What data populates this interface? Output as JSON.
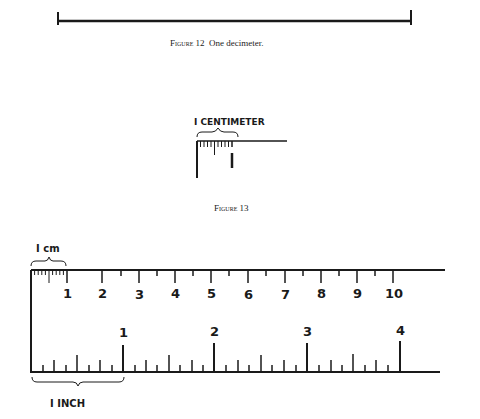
{
  "figure12": {
    "caption_label": "Figure 12",
    "caption_text": "One decimeter.",
    "line": {
      "x1": 58,
      "x2": 411,
      "y": 22
    }
  },
  "figure13": {
    "annotation": "I CENTIMETER",
    "caption": "Figure 13"
  },
  "figure14": {
    "cm_annotation": "I cm",
    "inch_annotation": "I INCH",
    "cm_labels": [
      "1",
      "2",
      "3",
      "4",
      "5",
      "6",
      "7",
      "8",
      "9",
      "10"
    ],
    "inch_labels": [
      "1",
      "2",
      "3",
      "4"
    ]
  }
}
